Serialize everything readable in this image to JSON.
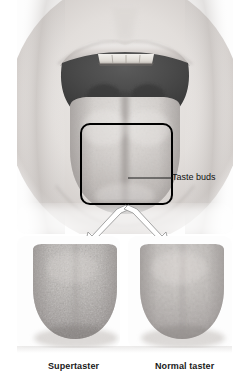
{
  "figure": {
    "title_visible": false,
    "background_color": "#ffffff",
    "panels": {
      "top": {
        "name": "open-mouth-photograph",
        "card_color": "#fdfdfd",
        "description_visible": false
      },
      "bottom_left": {
        "name": "supertaster-tongue-sample",
        "caption": "Supertaster",
        "card_color": "#fdfdfd"
      },
      "bottom_right": {
        "name": "normal-taster-tongue-sample",
        "caption": "Normal taster",
        "card_color": "#fdfdfd"
      }
    },
    "annotations": {
      "callout_label": "Taste buds",
      "callout_box_color": "#000000",
      "leader_line_color": "#1a1a1a",
      "arrow_fill": "#ffffff",
      "arrow_stroke": "#9a9a9a"
    },
    "colors": {
      "skin_light": "#e9e6e4",
      "skin_mid": "#cfcac7",
      "skin_shadow": "#a8a3a1",
      "lip_line": "#8e8987",
      "oral_cavity": "#4a4a4a",
      "oral_cavity_deep": "#3a3a3a",
      "teeth": "#e4e2dd",
      "tongue_light": "#d6d2cf",
      "tongue_mid": "#b9b4b1",
      "tongue_shadow": "#8d8886",
      "sample_tongue_light": "#c3bfbc",
      "sample_tongue_mid": "#a9a4a1",
      "sample_tongue_dark": "#8b8684",
      "caption_text": "#1a1a1a"
    }
  }
}
